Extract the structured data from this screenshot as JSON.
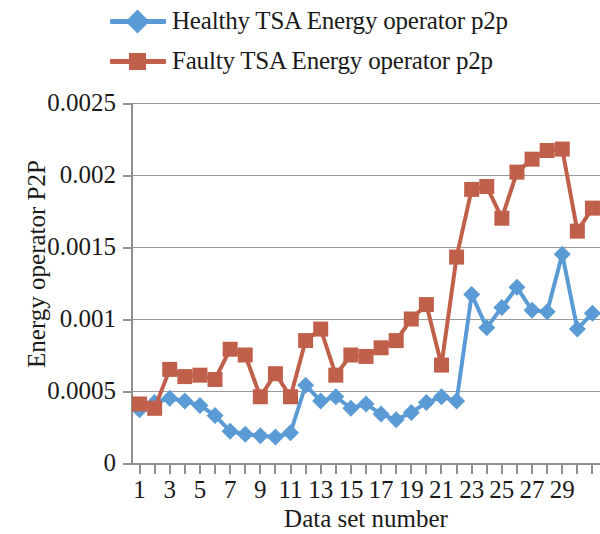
{
  "legend": {
    "position": "top",
    "items": [
      {
        "label": "Healthy TSA Energy operator p2p",
        "color": "#5B9BD5",
        "marker": "diamond",
        "marker_icon": "legend-diamond-icon"
      },
      {
        "label": "Faulty TSA Energy operator p2p",
        "color": "#C0604B",
        "marker": "square",
        "marker_icon": "legend-square-icon"
      }
    ]
  },
  "chart_data": {
    "type": "line",
    "title": "",
    "xlabel": "Data set number",
    "ylabel": "Energy operator P2P",
    "xlim": [
      0.5,
      31.5
    ],
    "ylim": [
      0,
      0.0025
    ],
    "ytick_labels": [
      "0",
      "0.0005",
      "0.001",
      "0.0015",
      "0.002",
      "0.0025"
    ],
    "ytick_values": [
      0,
      0.0005,
      0.001,
      0.0015,
      0.002,
      0.0025
    ],
    "xtick_labels": [
      "1",
      "3",
      "5",
      "7",
      "9",
      "11",
      "13",
      "15",
      "17",
      "19",
      "21",
      "23",
      "25",
      "27",
      "29"
    ],
    "xtick_values": [
      1,
      3,
      5,
      7,
      9,
      11,
      13,
      15,
      17,
      19,
      21,
      23,
      25,
      27,
      29
    ],
    "grid": "horizontal",
    "x": [
      1,
      2,
      3,
      4,
      5,
      6,
      7,
      8,
      9,
      10,
      11,
      12,
      13,
      14,
      15,
      16,
      17,
      18,
      19,
      20,
      21,
      22,
      23,
      24,
      25,
      26,
      27,
      28,
      29,
      30,
      31
    ],
    "series": [
      {
        "name": "Healthy TSA Energy operator p2p",
        "color": "#5B9BD5",
        "marker": "diamond",
        "values": [
          0.00037,
          0.00042,
          0.00045,
          0.00043,
          0.0004,
          0.00033,
          0.00022,
          0.0002,
          0.00019,
          0.00018,
          0.00021,
          0.00054,
          0.00043,
          0.00046,
          0.00038,
          0.00041,
          0.00034,
          0.0003,
          0.00035,
          0.00042,
          0.00046,
          0.00043,
          0.00117,
          0.00094,
          0.00108,
          0.00122,
          0.00106,
          0.00105,
          0.00145,
          0.00093,
          0.00104
        ]
      },
      {
        "name": "Faulty TSA Energy operator p2p",
        "color": "#C0604B",
        "marker": "square",
        "values": [
          0.00041,
          0.00038,
          0.00065,
          0.0006,
          0.00061,
          0.00058,
          0.00079,
          0.00075,
          0.00046,
          0.00062,
          0.00046,
          0.00085,
          0.00093,
          0.00061,
          0.00075,
          0.00074,
          0.0008,
          0.00085,
          0.001,
          0.0011,
          0.00068,
          0.00143,
          0.0019,
          0.00192,
          0.0017,
          0.00202,
          0.00211,
          0.00217,
          0.00218,
          0.00161,
          0.00177
        ]
      }
    ]
  }
}
